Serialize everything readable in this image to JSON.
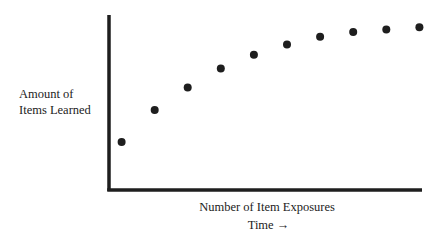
{
  "chart_data": {
    "type": "scatter",
    "title": "",
    "xlabel": "Number of Item Exposures",
    "xlabel_secondary": "Time →",
    "ylabel": "Amount of Items Learned",
    "ylabel_lines": [
      "Amount of",
      "Items Learned"
    ],
    "x": [
      1,
      2,
      3,
      4,
      5,
      6,
      7,
      8,
      9,
      10
    ],
    "y": [
      27.5,
      45.7,
      58.5,
      69.5,
      77.3,
      83.2,
      87.6,
      90.3,
      91.8,
      93.0
    ],
    "xlim": [
      0.62,
      10.08
    ],
    "ylim": [
      0,
      100
    ],
    "x_ticks": [],
    "y_ticks": [],
    "grid": false,
    "legend": "none",
    "marker_color": "#1e1e1e",
    "axis_color": "#1e1e1e"
  }
}
